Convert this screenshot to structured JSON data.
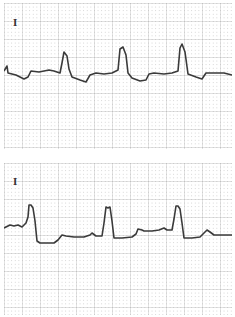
{
  "figure": {
    "type": "ecg_strip",
    "panels": [
      {
        "lead_label": "I",
        "trace": "M0,68 L3,63 L4,70 L12,72 L20,76 L24,74 L27,68 L35,69 L45,67 L50,68 L56,70 L58,60 L60,49 L63,53 L65,66 L68,74 L76,77 L82,79 L86,72 L92,70 L100,71 L108,70 L114,67 L116,46 L119,44 L122,52 L124,70 L128,75 L136,78 L142,77 L145,71 L150,70 L160,71 L168,70 L174,68 L176,45 L178,41 L181,49 L184,71 L192,74 L198,76 L202,70 L210,70 L220,70 L228,72"
      },
      {
        "lead_label": "I",
        "trace": "M0,65 L6,62 L10,63 L14,62 L18,64 L22,60 L24,54 L25,42 L27,42 L29,45 L31,58 L33,78 L36,80 L44,80 L50,80 L54,77 L58,72 L62,73 L70,74 L80,74 L86,72 L88,70 L92,73 L98,73 L100,60 L102,44 L104,45 L106,44 L108,58 L110,75 L118,75 L128,74 L132,71 L134,66 L138,67 L140,68 L148,68 L155,67 L160,65 L163,67 L168,67 L170,56 L172,43 L174,43 L176,46 L178,60 L180,75 L188,75 L196,74 L200,70 L203,67 L206,69 L210,72 L220,72 L228,72"
      }
    ],
    "grid": {
      "minor_px": 3.6,
      "major_px": 18,
      "minor_color": "#c8c8c8",
      "major_color": "#b4b4b4"
    },
    "trace_color": "#3a3a3a"
  }
}
